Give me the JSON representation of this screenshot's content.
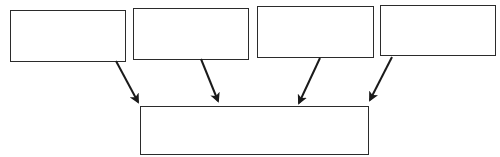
{
  "diagram": {
    "type": "many-to-one flow",
    "stroke_color": "#2b2b2b",
    "background": "#ffffff",
    "source_boxes": [
      {
        "id": "box-1",
        "label": "",
        "x": 10,
        "y": 10,
        "w": 116,
        "h": 52
      },
      {
        "id": "box-2",
        "label": "",
        "x": 133,
        "y": 8,
        "w": 116,
        "h": 52
      },
      {
        "id": "box-3",
        "label": "",
        "x": 257,
        "y": 6,
        "w": 117,
        "h": 52
      },
      {
        "id": "box-4",
        "label": "",
        "x": 380,
        "y": 5,
        "w": 116,
        "h": 51
      }
    ],
    "target_box": {
      "id": "box-target",
      "label": "",
      "x": 140,
      "y": 106,
      "w": 229,
      "h": 49
    },
    "arrows": [
      {
        "from": "box-1",
        "to": "box-target",
        "x1": 116,
        "y1": 61,
        "x2": 138,
        "y2": 102
      },
      {
        "from": "box-2",
        "to": "box-target",
        "x1": 201,
        "y1": 59,
        "x2": 218,
        "y2": 101
      },
      {
        "from": "box-3",
        "to": "box-target",
        "x1": 320,
        "y1": 58,
        "x2": 299,
        "y2": 103
      },
      {
        "from": "box-4",
        "to": "box-target",
        "x1": 392,
        "y1": 57,
        "x2": 370,
        "y2": 100
      }
    ]
  }
}
